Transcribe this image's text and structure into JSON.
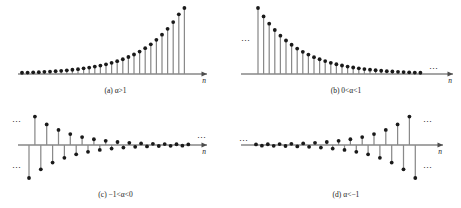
{
  "figure": {
    "background": "#ffffff",
    "stem_color": "#8a8a8a",
    "marker_color": "#1a1a1a",
    "axis_color": "#4d4d4d",
    "axis_label": "n",
    "ellipsis": "⋯"
  },
  "panels": [
    {
      "id": "panel-a",
      "caption_prefix": "(a)",
      "caption_expr": "α>1",
      "caption": "(a) α>1",
      "axis_label": "n",
      "baseline_y": 74,
      "axis_x0": 18,
      "axis_x1": 207,
      "show_left_ellipsis": false,
      "show_right_ellipsis": false,
      "show_upper_ellipsis": false,
      "show_lower_ellipsis": false,
      "n_stems": 30,
      "x_start": 22,
      "x_step": 5.6,
      "dot_r": 1.9,
      "values": [
        1.3,
        1.5,
        1.7,
        1.9,
        2.2,
        2.5,
        2.9,
        3.3,
        3.8,
        4.4,
        5.0,
        5.8,
        6.6,
        7.6,
        8.7,
        10.0,
        11.5,
        13.2,
        15.2,
        17.5,
        20.1,
        23.1,
        26.6,
        30.6,
        35.2,
        40.5,
        46.5,
        53.5,
        61.5,
        68.0
      ]
    },
    {
      "id": "panel-b",
      "caption_prefix": "(b)",
      "caption_expr": "0<α<1",
      "caption": "(b) 0<α<1",
      "axis_label": "n",
      "baseline_y": 74,
      "axis_x0": 10,
      "axis_x1": 222,
      "show_left_ellipsis": true,
      "show_right_ellipsis": true,
      "show_upper_ellipsis": false,
      "show_lower_ellipsis": false,
      "n_stems": 30,
      "x_start": 27,
      "x_step": 5.6,
      "dot_r": 1.9,
      "values": [
        63.0,
        55.0,
        48.0,
        42.0,
        36.6,
        32.0,
        27.9,
        24.3,
        21.2,
        18.5,
        16.1,
        14.1,
        12.3,
        10.7,
        9.3,
        8.1,
        7.1,
        6.2,
        5.4,
        4.7,
        4.1,
        3.6,
        3.1,
        2.7,
        2.4,
        2.1,
        1.8,
        1.6,
        1.4,
        1.2
      ]
    },
    {
      "id": "panel-c",
      "caption_prefix": "(c)",
      "caption_expr": "−1<α<0",
      "caption": "(c) −1<α<0",
      "axis_label": "n",
      "baseline_y": 41,
      "axis_x0": 18,
      "axis_x1": 207,
      "show_left_ellipsis": false,
      "show_right_ellipsis": true,
      "show_upper_ellipsis": true,
      "show_lower_ellipsis": true,
      "n_stems": 28,
      "x_start": 29,
      "x_step": 5.9,
      "dot_r": 1.9,
      "values": [
        -36.0,
        31.0,
        -26.5,
        22.5,
        -19.2,
        16.4,
        -14.0,
        11.9,
        -10.2,
        8.7,
        -7.4,
        6.3,
        -5.4,
        4.6,
        -3.9,
        3.3,
        -2.8,
        2.4,
        -2.0,
        1.7,
        -1.5,
        1.3,
        -1.1,
        1.0,
        -0.9,
        0.8,
        -0.7,
        0.6
      ]
    },
    {
      "id": "panel-d",
      "caption_prefix": "(d)",
      "caption_expr": "α<−1",
      "caption": "(d) α<−1",
      "axis_label": "n",
      "baseline_y": 41,
      "axis_x0": 10,
      "axis_x1": 212,
      "show_left_ellipsis": true,
      "show_right_ellipsis": false,
      "show_upper_ellipsis": true,
      "show_lower_ellipsis": true,
      "n_stems": 28,
      "x_start": 25,
      "x_step": 5.9,
      "dot_r": 1.9,
      "values": [
        0.6,
        -0.7,
        0.8,
        -0.9,
        1.0,
        -1.1,
        1.3,
        -1.5,
        1.7,
        -2.0,
        2.4,
        -2.8,
        3.3,
        -3.9,
        4.6,
        -5.4,
        6.3,
        -7.4,
        8.7,
        -10.2,
        11.9,
        -14.0,
        16.4,
        -19.2,
        22.5,
        -26.5,
        31.0,
        -36.0
      ]
    }
  ],
  "layout": {
    "panel_a": {
      "left": 0,
      "top": 0,
      "width": 231,
      "height": 104
    },
    "panel_b": {
      "left": 231,
      "top": 0,
      "width": 230,
      "height": 104
    },
    "panel_c": {
      "left": 0,
      "top": 104,
      "width": 231,
      "height": 104
    },
    "panel_d": {
      "left": 231,
      "top": 104,
      "width": 230,
      "height": 104
    },
    "caption_a_top": 86,
    "caption_b_top": 86,
    "caption_c_top": 190,
    "caption_d_top": 190
  }
}
